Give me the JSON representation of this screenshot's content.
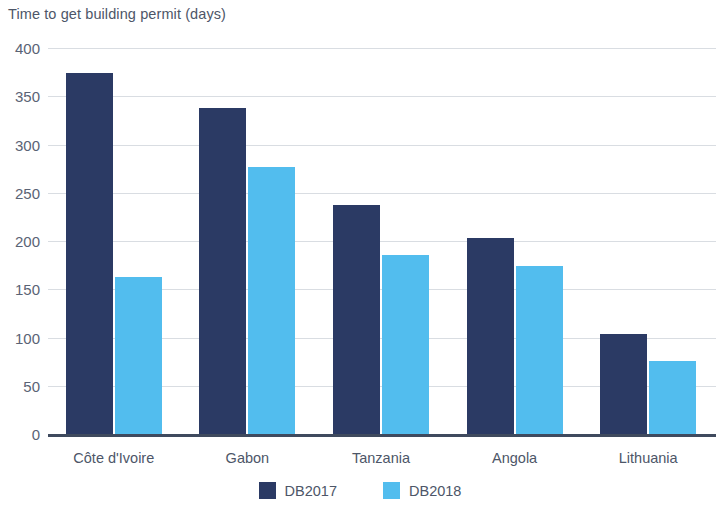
{
  "chart_data": {
    "type": "bar",
    "title": "Time to get building permit (days)",
    "xlabel": "",
    "ylabel": "",
    "ylim": [
      0,
      400
    ],
    "yticks": [
      0,
      50,
      100,
      150,
      200,
      250,
      300,
      350,
      400
    ],
    "grid": true,
    "legend_position": "bottom",
    "categories": [
      "Côte d'Ivoire",
      "Gabon",
      "Tanzania",
      "Angola",
      "Lithuania"
    ],
    "series": [
      {
        "name": "DB2017",
        "color": "#2b3a64",
        "values": [
          374,
          338,
          237,
          203,
          104
        ]
      },
      {
        "name": "DB2018",
        "color": "#52bdee",
        "values": [
          163,
          277,
          185,
          174,
          76
        ]
      }
    ]
  },
  "colors": {
    "db2017": "#2b3a64",
    "db2018": "#52bdee",
    "gridline": "#d9dde2",
    "axis": "#3f4a5e",
    "text": "#4d5668"
  }
}
